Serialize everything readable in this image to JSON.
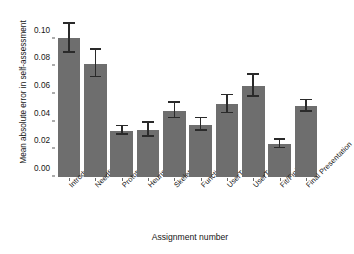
{
  "chart_data": {
    "type": "bar",
    "title": "",
    "xlabel": "Assignment number",
    "ylabel": "Mean absolute error in self-assessment",
    "grid": false,
    "legend": null,
    "ylim": [
      0.0,
      0.115
    ],
    "yticks": [
      "0.00",
      "0.02",
      "0.04",
      "0.06",
      "0.08",
      "0.10"
    ],
    "ytick_values": [
      0.0,
      0.02,
      0.04,
      0.06,
      0.08,
      0.1
    ],
    "categories": [
      "Introduction",
      "Needfinding",
      "Prototyping",
      "Heuristic eval.",
      "Skeleton/Plan",
      "Functionality",
      "UserTesting1",
      "UserTesting2",
      "Fit/Finish",
      "Final Presentation"
    ],
    "values": [
      0.1005,
      0.082,
      0.0335,
      0.0342,
      0.048,
      0.0378,
      0.0527,
      0.0658,
      0.0236,
      0.0512
    ],
    "errors_low": [
      0.09,
      0.0722,
      0.0305,
      0.0292,
      0.0425,
      0.0335,
      0.0462,
      0.058,
      0.0208,
      0.047
    ],
    "errors_high": [
      0.111,
      0.0918,
      0.0368,
      0.0392,
      0.0535,
      0.0425,
      0.0592,
      0.0738,
      0.0268,
      0.0555
    ],
    "bar_color": "#6e6e6e",
    "error_color": "#2a2a2a",
    "background_color": "#ffffff"
  }
}
